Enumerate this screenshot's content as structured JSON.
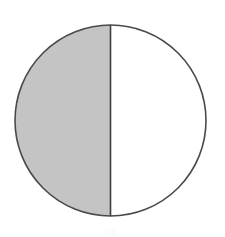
{
  "figure": {
    "title": "Circle divided into two equal halves with one half shaded",
    "kind": "fraction-area-model",
    "shape": "circle",
    "background_color": "#ffffff",
    "canvas": {
      "width": 225,
      "height": 237
    }
  },
  "chart_data": {
    "type": "pie",
    "title": "",
    "subtitle": "",
    "xlabel": "",
    "ylabel": "",
    "grid": false,
    "legend": false,
    "legend_position": "none",
    "total_parts": 2,
    "shaded_parts": 1,
    "fraction_label": "1/2",
    "fraction_value": 0.5,
    "percent": 50,
    "degrees_shaded": 180,
    "start_angle_deg": 0,
    "categories": [
      "shaded",
      "unshaded"
    ],
    "values": [
      50,
      50
    ],
    "labels": [
      "",
      ""
    ],
    "slices": [
      {
        "name": "shaded",
        "value": 50,
        "fraction": 0.5,
        "degrees": 180,
        "side": "left",
        "fill": "#c4c4c4",
        "stroke": "#4a4a4a",
        "label": ""
      },
      {
        "name": "unshaded",
        "value": 50,
        "fraction": 0.5,
        "degrees": 180,
        "side": "right",
        "fill": "#ffffff",
        "stroke": "#4a4a4a",
        "label": ""
      }
    ],
    "annotations": []
  },
  "geometry": {
    "center_x": 110.5,
    "center_y": 120.5,
    "radius": 95.5,
    "left_edge_x": 15,
    "right_edge_x": 206,
    "top_edge_y": 25,
    "bottom_edge_y": 216,
    "divider_x": 110.5,
    "divider_top_y": 25,
    "divider_bottom_y": 216,
    "stroke_width": 1.6
  },
  "colors": {
    "shaded_fill": "#c4c4c4",
    "unshaded_fill": "#ffffff",
    "outline": "#4a4a4a",
    "divider": "#3f3f3f",
    "background": "#ffffff",
    "artifact": "#fcfcfc"
  },
  "artifact": {
    "x": 106,
    "y": 229,
    "width": 10,
    "height": 6
  }
}
